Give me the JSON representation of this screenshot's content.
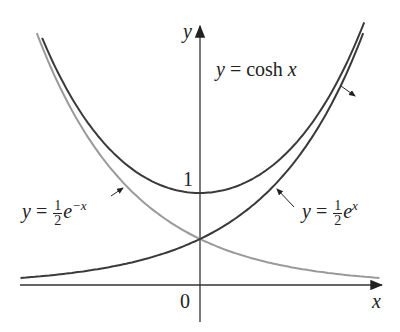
{
  "chart_data": {
    "type": "line",
    "title": "",
    "xlabel": "x",
    "ylabel": "y",
    "xlim": [
      -1.9,
      1.9
    ],
    "ylim": [
      0,
      2.8
    ],
    "grid": false,
    "legend": "none (curve annotations with arrows)",
    "ticks": {
      "x": [
        "0"
      ],
      "y": [
        "1"
      ]
    },
    "series": [
      {
        "name": "y = cosh x",
        "function": "cosh(x)",
        "color": "#3a3a3a",
        "x": [
          -1.6,
          -1.2,
          -0.8,
          -0.4,
          0,
          0.4,
          0.8,
          1.2,
          1.6
        ],
        "y": [
          2.58,
          1.81,
          1.34,
          1.08,
          1.0,
          1.08,
          1.34,
          1.81,
          2.58
        ]
      },
      {
        "name": "y = 1/2 e^x",
        "function": "0.5*exp(x)",
        "color": "#3a3a3a",
        "x": [
          -1.9,
          -1.2,
          -0.8,
          -0.4,
          0,
          0.4,
          0.8,
          1.2,
          1.6
        ],
        "y": [
          0.07,
          0.15,
          0.22,
          0.34,
          0.5,
          0.75,
          1.11,
          1.66,
          2.48
        ]
      },
      {
        "name": "y = 1/2 e^-x",
        "function": "0.5*exp(-x)",
        "color": "#999999",
        "x": [
          -1.6,
          -1.2,
          -0.8,
          -0.4,
          0,
          0.4,
          0.8,
          1.2,
          1.9
        ],
        "y": [
          2.48,
          1.66,
          1.11,
          0.75,
          0.5,
          0.34,
          0.22,
          0.15,
          0.07
        ]
      }
    ],
    "annotations": [
      "y = cosh x",
      "y = ½e^{-x}",
      "y = ½e^{x}",
      "1",
      "0"
    ]
  },
  "labels": {
    "y_axis": "y",
    "x_axis": "x",
    "origin": "0",
    "one": "1",
    "cosh_lhs": "y",
    "cosh_rhs": " = cosh ",
    "cosh_var": "x",
    "emx_lhs": "y",
    "eq": " = ",
    "half_num": "1",
    "half_den": "2",
    "e": "e",
    "emx_exp": "−x",
    "ex_lhs": "y",
    "ex_exp": "x"
  }
}
